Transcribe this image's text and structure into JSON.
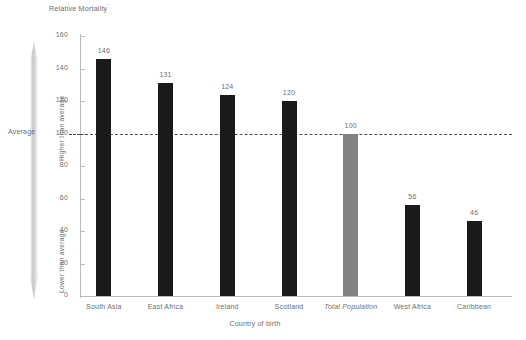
{
  "chart_data": {
    "type": "bar",
    "title": "Relative Mortality",
    "title_footnote": "'",
    "xlabel": "Country of birth",
    "ylabel": "",
    "ylim": [
      0,
      160
    ],
    "yticks": [
      0,
      20,
      40,
      60,
      80,
      100,
      120,
      140,
      160
    ],
    "grid": false,
    "legend": "none",
    "categories": [
      "South Asia",
      "East Africa",
      "Ireland",
      "Scotland",
      "Total Population",
      "West Africa",
      "Caribbean"
    ],
    "values": [
      146,
      131,
      124,
      120,
      100,
      56,
      46
    ],
    "bar_colors": [
      "#1a1a1a",
      "#1a1a1a",
      "#1a1a1a",
      "#1a1a1a",
      "#808285",
      "#1a1a1a",
      "#1a1a1a"
    ],
    "emphasis_category": "Total Population",
    "reference_line": {
      "value": 100,
      "label": "Average",
      "style": "dashed"
    },
    "annotations": {
      "above_label": "Higher than average",
      "below_label": "Lower than average",
      "midpoint_label": "Average"
    }
  },
  "colors": {
    "bar_dark": "#1a1a1a",
    "bar_gray": "#808285",
    "axis": "#b9babc",
    "text": "#6d6e70",
    "reference_line": "#4c4c4e",
    "arrow_fill": "#d6d7d9"
  }
}
